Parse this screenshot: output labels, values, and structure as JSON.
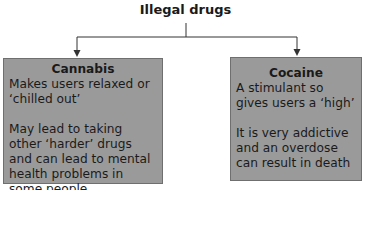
{
  "title": "Illegal drugs",
  "boxes": [
    {
      "heading": "Cannabis",
      "paragraphs": [
        "Makes users relaxed or ‘chilled out’",
        "May lead to taking other ‘harder’ drugs and can lead to mental health problems in some people"
      ]
    },
    {
      "heading": "Cocaine",
      "paragraphs": [
        "A stimulant so gives users a ‘high’",
        "It is very addictive and an overdose can result in death"
      ]
    }
  ],
  "colors": {
    "box_fill": "#9a9a9a",
    "box_border": "#6f6f6f",
    "line": "#333333"
  }
}
